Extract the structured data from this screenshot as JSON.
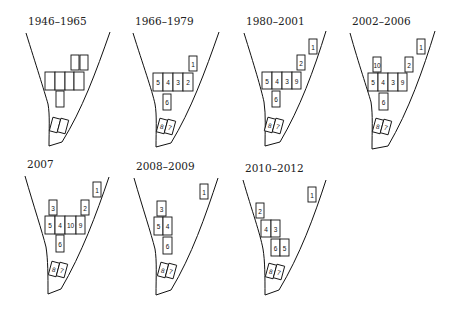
{
  "figure": {
    "panels": [
      {
        "title": "1946–1965",
        "origin": [
          0,
          0
        ],
        "boxes": [
          {
            "label": "",
            "x": 71,
            "y": 55,
            "w": 8,
            "h": 15
          },
          {
            "label": "",
            "x": 80,
            "y": 55,
            "w": 8,
            "h": 15
          },
          {
            "label": "",
            "x": 45,
            "y": 72,
            "w": 10,
            "h": 18
          },
          {
            "label": "",
            "x": 55,
            "y": 72,
            "w": 10,
            "h": 18
          },
          {
            "label": "",
            "x": 65,
            "y": 72,
            "w": 9,
            "h": 18
          },
          {
            "label": "",
            "x": 74,
            "y": 72,
            "w": 10,
            "h": 18
          },
          {
            "label": "",
            "x": 56,
            "y": 91,
            "w": 8,
            "h": 16
          },
          {
            "label": "",
            "x": 51,
            "y": 118,
            "w": 8,
            "h": 14,
            "rot": 15
          },
          {
            "label": "",
            "x": 59,
            "y": 119,
            "w": 8,
            "h": 14,
            "rot": 15
          }
        ]
      },
      {
        "title": "1966–1979",
        "origin": [
          115,
          0
        ],
        "boxes": [
          {
            "label": "1",
            "x": 74,
            "y": 56,
            "w": 8,
            "h": 15
          },
          {
            "label": "5",
            "x": 38,
            "y": 73,
            "w": 10,
            "h": 18
          },
          {
            "label": "4",
            "x": 48,
            "y": 73,
            "w": 10,
            "h": 18
          },
          {
            "label": "3",
            "x": 58,
            "y": 73,
            "w": 10,
            "h": 18
          },
          {
            "label": "2",
            "x": 68,
            "y": 73,
            "w": 10,
            "h": 18
          },
          {
            "label": "6",
            "x": 48,
            "y": 94,
            "w": 8,
            "h": 16
          },
          {
            "label": "8",
            "x": 43,
            "y": 119,
            "w": 8,
            "h": 14,
            "rot": 15
          },
          {
            "label": "7",
            "x": 51,
            "y": 120,
            "w": 8,
            "h": 14,
            "rot": 15
          }
        ]
      },
      {
        "title": "1980–2001",
        "origin": [
          230,
          0
        ],
        "boxes": [
          {
            "label": "1",
            "x": 79,
            "y": 39,
            "w": 8,
            "h": 15
          },
          {
            "label": "2",
            "x": 67,
            "y": 55,
            "w": 8,
            "h": 15
          },
          {
            "label": "5",
            "x": 32,
            "y": 72,
            "w": 10,
            "h": 17
          },
          {
            "label": "4",
            "x": 42,
            "y": 72,
            "w": 10,
            "h": 17
          },
          {
            "label": "3",
            "x": 52,
            "y": 72,
            "w": 10,
            "h": 17
          },
          {
            "label": "9",
            "x": 62,
            "y": 72,
            "w": 9,
            "h": 17
          },
          {
            "label": "6",
            "x": 42,
            "y": 91,
            "w": 8,
            "h": 16
          },
          {
            "label": "8",
            "x": 36,
            "y": 118,
            "w": 8,
            "h": 14,
            "rot": 15
          },
          {
            "label": "7",
            "x": 44,
            "y": 119,
            "w": 8,
            "h": 14,
            "rot": 15
          }
        ]
      },
      {
        "title": "2002–2006",
        "origin": [
          345,
          0
        ],
        "boxes": [
          {
            "label": "1",
            "x": 72,
            "y": 39,
            "w": 8,
            "h": 15
          },
          {
            "label": "10",
            "x": 28,
            "y": 57,
            "w": 8,
            "h": 15
          },
          {
            "label": "2",
            "x": 60,
            "y": 57,
            "w": 8,
            "h": 15
          },
          {
            "label": "5",
            "x": 23,
            "y": 73,
            "w": 10,
            "h": 18
          },
          {
            "label": "4",
            "x": 33,
            "y": 73,
            "w": 10,
            "h": 18
          },
          {
            "label": "3",
            "x": 43,
            "y": 73,
            "w": 10,
            "h": 18
          },
          {
            "label": "9",
            "x": 53,
            "y": 73,
            "w": 9,
            "h": 18
          },
          {
            "label": "6",
            "x": 34,
            "y": 93,
            "w": 9,
            "h": 17
          },
          {
            "label": "8",
            "x": 29,
            "y": 119,
            "w": 8,
            "h": 14,
            "rot": 15
          },
          {
            "label": "7",
            "x": 37,
            "y": 120,
            "w": 8,
            "h": 14,
            "rot": 15
          }
        ]
      },
      {
        "title": "2007",
        "origin": [
          0,
          157
        ],
        "boxes": [
          {
            "label": "1",
            "x": 93,
            "y": 25,
            "w": 8,
            "h": 15
          },
          {
            "label": "3",
            "x": 49,
            "y": 43,
            "w": 8,
            "h": 15
          },
          {
            "label": "2",
            "x": 81,
            "y": 43,
            "w": 8,
            "h": 15
          },
          {
            "label": "5",
            "x": 45,
            "y": 59,
            "w": 10,
            "h": 18
          },
          {
            "label": "4",
            "x": 55,
            "y": 59,
            "w": 10,
            "h": 18
          },
          {
            "label": "10",
            "x": 65,
            "y": 59,
            "w": 11,
            "h": 18
          },
          {
            "label": "9",
            "x": 76,
            "y": 59,
            "w": 9,
            "h": 18
          },
          {
            "label": "6",
            "x": 56,
            "y": 78,
            "w": 8,
            "h": 17
          },
          {
            "label": "8",
            "x": 50,
            "y": 105,
            "w": 8,
            "h": 14,
            "rot": 15
          },
          {
            "label": "7",
            "x": 58,
            "y": 106,
            "w": 8,
            "h": 14,
            "rot": 15
          }
        ]
      },
      {
        "title": "2008–2009",
        "origin": [
          115,
          157
        ],
        "boxes": [
          {
            "label": "1",
            "x": 85,
            "y": 27,
            "w": 8,
            "h": 15
          },
          {
            "label": "3",
            "x": 42,
            "y": 44,
            "w": 9,
            "h": 15
          },
          {
            "label": "5",
            "x": 39,
            "y": 60,
            "w": 9,
            "h": 18
          },
          {
            "label": "4",
            "x": 48,
            "y": 60,
            "w": 9,
            "h": 18
          },
          {
            "label": "6",
            "x": 48,
            "y": 80,
            "w": 9,
            "h": 17
          },
          {
            "label": "8",
            "x": 44,
            "y": 106,
            "w": 8,
            "h": 14,
            "rot": 15
          },
          {
            "label": "7",
            "x": 52,
            "y": 107,
            "w": 8,
            "h": 14,
            "rot": 15
          }
        ]
      },
      {
        "title": "2010–2012",
        "origin": [
          230,
          157
        ],
        "boxes": [
          {
            "label": "1",
            "x": 78,
            "y": 30,
            "w": 8,
            "h": 15
          },
          {
            "label": "2",
            "x": 26,
            "y": 46,
            "w": 8,
            "h": 15
          },
          {
            "label": "4",
            "x": 31,
            "y": 63,
            "w": 10,
            "h": 17
          },
          {
            "label": "3",
            "x": 41,
            "y": 63,
            "w": 9,
            "h": 17
          },
          {
            "label": "6",
            "x": 41,
            "y": 82,
            "w": 9,
            "h": 17
          },
          {
            "label": "5",
            "x": 50,
            "y": 82,
            "w": 9,
            "h": 17
          },
          {
            "label": "8",
            "x": 37,
            "y": 107,
            "w": 8,
            "h": 14,
            "rot": 15
          },
          {
            "label": "7",
            "x": 45,
            "y": 108,
            "w": 8,
            "h": 14,
            "rot": 15
          }
        ]
      }
    ],
    "outline_shapes": [
      {
        "panel": 0,
        "left": "M26,33 C36,65 44,90 48,104 C50,115 49,130 49,146",
        "right": "M110,32 C96,72 82,110 62,142 L49,146"
      },
      {
        "panel": 1,
        "left": "M18,33 C28,65 37,90 40,104 C42,115 41,130 41,147",
        "right": "M104,32 C90,72 76,110 56,143 L41,147"
      },
      {
        "panel": 2,
        "left": "M14,33 C24,65 31,88 34,102 C36,115 35,130 35,146",
        "right": "M96,31 C84,70 70,108 50,142 L35,146"
      },
      {
        "panel": 3,
        "left": "M5,33 C14,65 22,88 26,102 C28,115 27,130 27,149",
        "right": "M90,31 C78,70 64,110 43,146 L27,149"
      },
      {
        "panel": 4,
        "left": "M25,19 C34,50 42,74 46,90 C48,103 48,118 48,137",
        "right": "M109,20 C96,58 82,96 61,132 L48,137"
      },
      {
        "panel": 5,
        "left": "M19,21 C28,52 36,76 40,92 C42,104 41,120 41,138",
        "right": "M103,21 C90,60 77,98 56,133 L41,138"
      },
      {
        "panel": 6,
        "left": "M13,23 C22,54 30,76 33,92 C35,104 35,120 35,138",
        "right": "M96,23 C84,60 70,98 49,133 L35,138"
      }
    ]
  }
}
